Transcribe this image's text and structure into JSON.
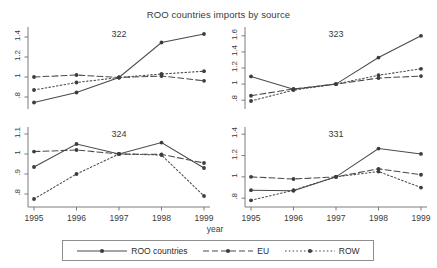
{
  "chart_data": {
    "type": "line",
    "title": "ROO countries imports by source",
    "xlabel": "year",
    "ylabel": "",
    "x": [
      1995,
      1996,
      1997,
      1998,
      1999
    ],
    "xtick_labels": [
      "1995",
      "1996",
      "1997",
      "1998",
      "1999"
    ],
    "legend_position": "bottom",
    "grid": false,
    "panels": [
      {
        "name": "322",
        "ylim": [
          0.72,
          1.46
        ],
        "yticks": [
          0.8,
          1,
          1.2,
          1.4
        ],
        "ytick_labels": [
          ".8",
          "1",
          "1.2",
          "1.4"
        ],
        "series": [
          {
            "name": "ROO countries",
            "style": "solid",
            "values": [
              0.745,
              0.845,
              0.995,
              1.345,
              1.43
            ]
          },
          {
            "name": "EU",
            "style": "dashed",
            "values": [
              1.0,
              1.02,
              0.995,
              1.01,
              0.962
            ]
          },
          {
            "name": "ROW",
            "style": "dotted",
            "values": [
              0.87,
              0.945,
              0.995,
              1.03,
              1.058
            ]
          }
        ]
      },
      {
        "name": "323",
        "ylim": [
          0.74,
          1.66
        ],
        "yticks": [
          0.8,
          1,
          1.2,
          1.4,
          1.6
        ],
        "ytick_labels": [
          ".8",
          "1",
          "1.2",
          "1.4",
          "1.6"
        ],
        "series": [
          {
            "name": "ROO countries",
            "style": "solid",
            "values": [
              1.095,
              0.935,
              1.0,
              1.33,
              1.6
            ]
          },
          {
            "name": "EU",
            "style": "dashed",
            "values": [
              0.855,
              0.94,
              1.0,
              1.075,
              1.1
            ]
          },
          {
            "name": "ROW",
            "style": "dotted",
            "values": [
              0.79,
              0.925,
              1.0,
              1.11,
              1.19
            ]
          }
        ]
      },
      {
        "name": "324",
        "ylim": [
          0.755,
          1.115
        ],
        "yticks": [
          0.8,
          0.9,
          1,
          1.1
        ],
        "ytick_labels": [
          ".8",
          ".9",
          "1",
          "1.1"
        ],
        "series": [
          {
            "name": "ROO countries",
            "style": "solid",
            "values": [
              0.935,
              1.05,
              1.0,
              1.057,
              0.93
            ]
          },
          {
            "name": "EU",
            "style": "dashed",
            "values": [
              1.012,
              1.02,
              1.0,
              0.998,
              0.955
            ]
          },
          {
            "name": "ROW",
            "style": "dotted",
            "values": [
              0.775,
              0.9,
              1.0,
              0.995,
              0.79
            ]
          }
        ]
      },
      {
        "name": "331",
        "ylim": [
          0.755,
          1.43
        ],
        "yticks": [
          0.8,
          1,
          1.2,
          1.4
        ],
        "ytick_labels": [
          ".8",
          "1",
          "1.2",
          "1.4"
        ],
        "series": [
          {
            "name": "ROO countries",
            "style": "solid",
            "values": [
              0.875,
              0.87,
              1.0,
              1.265,
              1.215
            ]
          },
          {
            "name": "EU",
            "style": "dashed",
            "values": [
              1.0,
              0.98,
              1.0,
              1.075,
              1.02
            ]
          },
          {
            "name": "ROW",
            "style": "dotted",
            "values": [
              0.78,
              0.875,
              1.0,
              1.05,
              0.9
            ]
          }
        ]
      }
    ],
    "legend": [
      {
        "label": "ROO countries",
        "style": "solid"
      },
      {
        "label": "EU",
        "style": "dashed"
      },
      {
        "label": "ROW",
        "style": "dotted"
      }
    ],
    "colors": {
      "line": "#4a4a4a",
      "marker": "#3d3d3d",
      "axis": "#6e6e6e",
      "text": "#2b2b2b"
    }
  }
}
